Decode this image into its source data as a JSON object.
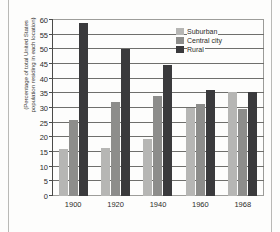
{
  "chart_data": {
    "type": "bar",
    "title": "",
    "xlabel": "",
    "ylabel": "(Percentage of total United States population residing in each location)",
    "ylabel_lines": [
      "(Percentage of total United States",
      "population residing in each location)"
    ],
    "categories": [
      "1900",
      "1920",
      "1940",
      "1960",
      "1968"
    ],
    "series": [
      {
        "name": "Suburban",
        "color": "#b6b6b4",
        "values": [
          16,
          16.5,
          19.5,
          30,
          35.5
        ]
      },
      {
        "name": "Central city",
        "color": "#8d8d8b",
        "values": [
          26,
          32,
          34,
          31.5,
          29.5
        ]
      },
      {
        "name": "Rural",
        "color": "#3a3a3c",
        "values": [
          59,
          50,
          44.5,
          36,
          35.5
        ]
      }
    ],
    "ylim": [
      0,
      60
    ],
    "ytick_values": [
      0,
      5,
      10,
      15,
      20,
      25,
      30,
      35,
      40,
      45,
      50,
      55,
      60
    ],
    "ytick_labels": [
      "0",
      "5",
      "10",
      "15",
      "20",
      "25",
      "30",
      "35",
      "40",
      "45",
      "50",
      "55",
      "60"
    ],
    "grid": true,
    "grid_axis": "y",
    "legend_position": "top-right"
  },
  "legend": {
    "items": [
      {
        "label": "Suburban"
      },
      {
        "label": "Central city"
      },
      {
        "label": "Rural"
      }
    ]
  }
}
